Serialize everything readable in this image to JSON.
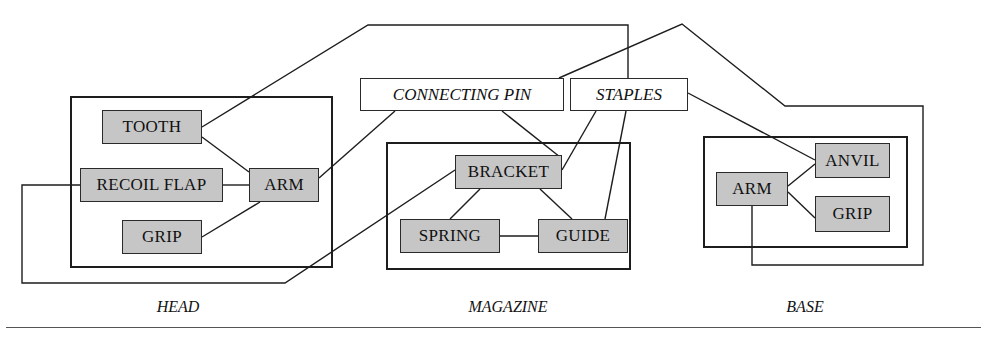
{
  "diagram": {
    "title_present": false,
    "type": "block-connection-diagram",
    "stroke_color": "#1d1d1d",
    "node_fill": "#c6c6c6",
    "interface_fill": "#ffffff",
    "groups": [
      {
        "id": "head",
        "label": "HEAD",
        "label_x": 178,
        "label_y": 298,
        "box": {
          "x": 70,
          "y": 96,
          "w": 263,
          "h": 172
        }
      },
      {
        "id": "magazine",
        "label": "MAGAZINE",
        "label_x": 508,
        "label_y": 298,
        "box": {
          "x": 386,
          "y": 142,
          "w": 245,
          "h": 128
        }
      },
      {
        "id": "base",
        "label": "BASE",
        "label_x": 805,
        "label_y": 298,
        "box": {
          "x": 703,
          "y": 136,
          "w": 205,
          "h": 112
        }
      }
    ],
    "nodes": [
      {
        "id": "tooth",
        "label": "TOOTH",
        "group": "head",
        "x": 102,
        "y": 110,
        "w": 100,
        "h": 34
      },
      {
        "id": "recoil_flap",
        "label": "RECOIL FLAP",
        "group": "head",
        "x": 80,
        "y": 168,
        "w": 143,
        "h": 34
      },
      {
        "id": "grip_head",
        "label": "GRIP",
        "group": "head",
        "x": 122,
        "y": 220,
        "w": 80,
        "h": 34
      },
      {
        "id": "arm_head",
        "label": "ARM",
        "group": "head",
        "x": 249,
        "y": 168,
        "w": 70,
        "h": 34
      },
      {
        "id": "bracket",
        "label": "BRACKET",
        "group": "magazine",
        "x": 455,
        "y": 155,
        "w": 107,
        "h": 34
      },
      {
        "id": "spring",
        "label": "SPRING",
        "group": "magazine",
        "x": 400,
        "y": 219,
        "w": 100,
        "h": 34
      },
      {
        "id": "guide",
        "label": "GUIDE",
        "group": "magazine",
        "x": 538,
        "y": 219,
        "w": 90,
        "h": 34
      },
      {
        "id": "arm_base",
        "label": "ARM",
        "group": "base",
        "x": 716,
        "y": 172,
        "w": 72,
        "h": 34
      },
      {
        "id": "anvil",
        "label": "ANVIL",
        "group": "base",
        "x": 815,
        "y": 143,
        "w": 75,
        "h": 35
      },
      {
        "id": "grip_base",
        "label": "GRIP",
        "group": "base",
        "x": 815,
        "y": 196,
        "w": 75,
        "h": 36
      }
    ],
    "interface_nodes": [
      {
        "id": "connecting_pin",
        "label": "CONNECTING PIN",
        "x": 360,
        "y": 78,
        "w": 204,
        "h": 33
      },
      {
        "id": "staples",
        "label": "STAPLES",
        "x": 570,
        "y": 78,
        "w": 118,
        "h": 33
      }
    ],
    "edges": [
      {
        "id": "tooth-arm",
        "from": "tooth",
        "to": "arm_head",
        "points": "202,137 249,172"
      },
      {
        "id": "recoilflap-arm",
        "from": "recoil_flap",
        "to": "arm_head",
        "points": "223,185 249,185"
      },
      {
        "id": "grip-arm",
        "from": "grip_head",
        "to": "arm_head",
        "points": "202,237 260,202"
      },
      {
        "id": "bracket-spring",
        "from": "bracket",
        "to": "spring",
        "points": "480,189 450,219"
      },
      {
        "id": "bracket-guide",
        "from": "bracket",
        "to": "guide",
        "points": "540,189 572,219"
      },
      {
        "id": "spring-guide",
        "from": "spring",
        "to": "guide",
        "points": "500,236 538,236"
      },
      {
        "id": "arm-anvil",
        "from": "arm_base",
        "to": "anvil",
        "points": "788,186 815,164"
      },
      {
        "id": "arm-grip-base",
        "from": "arm_base",
        "to": "grip_base",
        "points": "788,192 815,218"
      },
      {
        "id": "tooth-staples",
        "from": "tooth",
        "to": "staples",
        "points": "202,127 368,25 628,25 628,78"
      },
      {
        "id": "arm-connectingpin",
        "from": "arm_head",
        "to": "connecting_pin",
        "points": "319,178 395,111"
      },
      {
        "id": "recoilflap-bracket",
        "from": "recoil_flap",
        "to": "bracket",
        "points": "80,185 22,185 22,283 285,283 455,170"
      },
      {
        "id": "connectingpin-bracket",
        "from": "connecting_pin",
        "to": "bracket",
        "points": "502,111 560,157"
      },
      {
        "id": "staples-bracket",
        "from": "staples",
        "to": "bracket",
        "points": "596,111 562,170"
      },
      {
        "id": "staples-guide",
        "from": "staples",
        "to": "guide",
        "points": "626,111 605,219"
      },
      {
        "id": "staples-anvil",
        "from": "staples",
        "to": "anvil",
        "points": "688,93 815,160"
      },
      {
        "id": "armbase-connectingpin",
        "from": "arm_base",
        "to": "connecting_pin",
        "points": "752,206 752,265 923,265 923,106 785,106 682,24 559,78"
      }
    ],
    "bottom_rule": {
      "y": 327,
      "x": 6,
      "w": 975
    }
  }
}
